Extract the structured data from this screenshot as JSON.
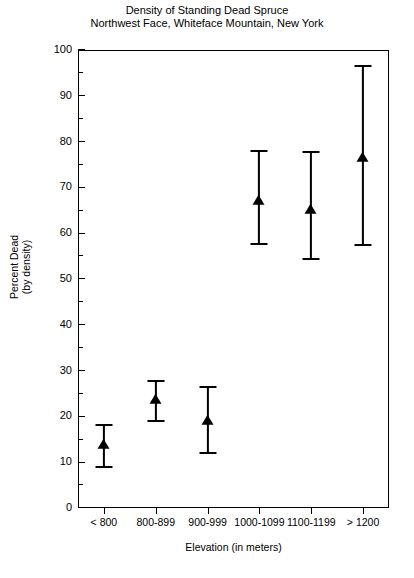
{
  "chart_data": {
    "type": "scatter",
    "title": "Density of Standing Dead Spruce",
    "subtitle": "Northwest Face, Whiteface Mountain, New York",
    "xlabel": "Elevation (in meters)",
    "ylabel": "Percent Dead",
    "ylabel_line2": "(by density)",
    "ylim": [
      0,
      100
    ],
    "ytick_step": 10,
    "yminor_step": 5,
    "grid": false,
    "legend": "none",
    "marker": "filled-triangle",
    "error_bars": "asymmetric",
    "categories": [
      "< 800",
      "800-899",
      "900-999",
      "1000-1099",
      "1100-1199",
      "> 1200"
    ],
    "values": [
      14,
      23.8,
      19.2,
      67.3,
      65.3,
      76.6
    ],
    "err_low": [
      9,
      19,
      12,
      57.6,
      54.4,
      57.4
    ],
    "err_high": [
      18.2,
      27.6,
      26.5,
      78,
      77.7,
      96.5
    ],
    "ytick_labels": [
      "0",
      "10",
      "20",
      "30",
      "40",
      "50",
      "60",
      "70",
      "80",
      "90",
      "100"
    ],
    "ytick_values": [
      0,
      10,
      20,
      30,
      40,
      50,
      60,
      70,
      80,
      90,
      100
    ],
    "yminor_values": [
      5,
      15,
      25,
      35,
      45,
      55,
      65,
      75,
      85,
      95
    ],
    "points": [
      {
        "category": "< 800",
        "value": 14,
        "low": 9,
        "high": 18.2
      },
      {
        "category": "800-899",
        "value": 23.8,
        "low": 19,
        "high": 27.6
      },
      {
        "category": "900-999",
        "value": 19.2,
        "low": 12,
        "high": 26.5
      },
      {
        "category": "1000-1099",
        "value": 67.3,
        "low": 57.6,
        "high": 78
      },
      {
        "category": "1100-1199",
        "value": 65.3,
        "low": 54.4,
        "high": 77.7
      },
      {
        "category": "> 1200",
        "value": 76.6,
        "low": 57.4,
        "high": 96.5
      }
    ],
    "colors": {
      "ink": "#000000",
      "background": "#ffffff"
    }
  }
}
